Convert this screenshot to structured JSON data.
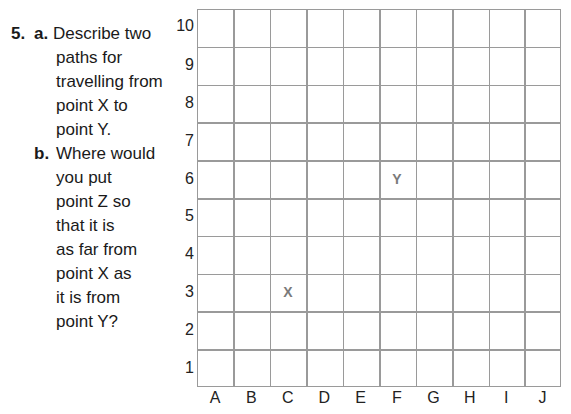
{
  "question": {
    "number": "5.",
    "part_a": {
      "label": "a.",
      "lines": [
        "Describe two",
        "paths for",
        "travelling from",
        "point X to",
        "point Y."
      ]
    },
    "part_b": {
      "label": "b.",
      "lines": [
        "Where would",
        "you put",
        "point Z so",
        "that it is",
        "as far from",
        "point X as",
        "it is from",
        "point Y?"
      ]
    }
  },
  "grid": {
    "rows": [
      "10",
      "9",
      "8",
      "7",
      "6",
      "5",
      "4",
      "3",
      "2",
      "1"
    ],
    "columns": [
      "A",
      "B",
      "C",
      "D",
      "E",
      "F",
      "G",
      "H",
      "I",
      "J"
    ],
    "line_color": "#9a9a9a",
    "points": [
      {
        "label": "X",
        "column": "C",
        "row": "3"
      },
      {
        "label": "Y",
        "column": "F",
        "row": "6"
      }
    ]
  }
}
